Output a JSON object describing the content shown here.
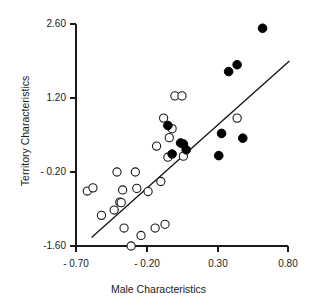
{
  "chart_data": {
    "type": "scatter",
    "title": "",
    "xlabel": "Male Characteristics",
    "ylabel": "Territory Characteristics",
    "xlim": [
      -0.7,
      0.8
    ],
    "ylim": [
      -1.6,
      2.6
    ],
    "xticks": [
      -0.7,
      -0.2,
      0.3,
      0.8
    ],
    "xtick_labels": [
      "- 0.70",
      "- 0.20",
      "0.30",
      "0.80"
    ],
    "yticks": [
      -1.6,
      -0.2,
      1.2,
      2.6
    ],
    "ytick_labels": [
      "-1.60",
      "- 0.20",
      "1.20",
      "2.60"
    ],
    "grid": false,
    "legend": "none",
    "series": [
      {
        "name": "open-circles",
        "marker": "open circle",
        "marker_color": "#ffffff",
        "marker_edge_color": "#1a1a1a",
        "points": [
          [
            -0.62,
            -0.56
          ],
          [
            -0.58,
            -0.5
          ],
          [
            -0.52,
            -1.02
          ],
          [
            -0.43,
            -0.92
          ],
          [
            -0.41,
            -0.2
          ],
          [
            -0.39,
            -0.77
          ],
          [
            -0.38,
            -0.78
          ],
          [
            -0.37,
            -0.54
          ],
          [
            -0.36,
            -1.26
          ],
          [
            -0.31,
            -1.6
          ],
          [
            -0.28,
            -0.2
          ],
          [
            -0.27,
            -0.51
          ],
          [
            -0.24,
            -1.4
          ],
          [
            -0.19,
            -0.57
          ],
          [
            -0.14,
            -1.26
          ],
          [
            -0.13,
            0.29
          ],
          [
            -0.1,
            -0.38
          ],
          [
            -0.08,
            0.82
          ],
          [
            -0.07,
            -1.19
          ],
          [
            -0.05,
            0.08
          ],
          [
            -0.04,
            0.45
          ],
          [
            -0.02,
            0.62
          ],
          [
            0.0,
            1.24
          ],
          [
            0.05,
            1.24
          ],
          [
            0.06,
            0.1
          ],
          [
            0.44,
            0.82
          ]
        ]
      },
      {
        "name": "filled-circles",
        "marker": "filled circle",
        "marker_color": "#000000",
        "marker_edge_color": "#000000",
        "points": [
          [
            -0.05,
            0.68
          ],
          [
            -0.02,
            0.14
          ],
          [
            0.04,
            0.35
          ],
          [
            0.06,
            0.33
          ],
          [
            0.08,
            0.22
          ],
          [
            0.31,
            0.11
          ],
          [
            0.33,
            0.53
          ],
          [
            0.38,
            1.7
          ],
          [
            0.44,
            1.83
          ],
          [
            0.48,
            0.44
          ],
          [
            0.62,
            2.52
          ]
        ]
      }
    ],
    "regression_line": {
      "name": "fit-line",
      "x_start": -0.59,
      "y_start": -1.44,
      "x_end": 0.81,
      "y_end": 1.9,
      "color": "#111111"
    }
  },
  "axes": {
    "x_title": "Male Characteristics",
    "y_title": "Territory Characteristics"
  }
}
